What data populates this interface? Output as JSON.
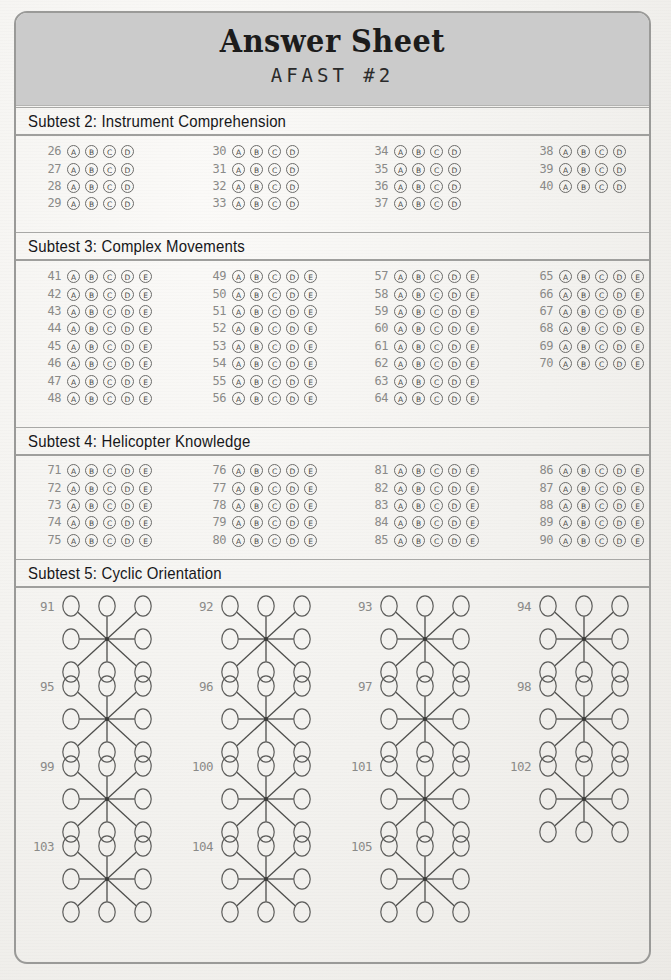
{
  "header": {
    "title": "Answer Sheet",
    "subtitle": "AFAST #2"
  },
  "colors": {
    "page_background": "#f3f2ef",
    "header_band": "#cbcbcb",
    "frame_border": "#9a9a98",
    "question_number": "#8a8a88",
    "bubble_stroke": "#6c6c6a",
    "text": "#17171a"
  },
  "sections": [
    {
      "id": "subtest-2",
      "title": "Subtest 2: Instrument Comprehension",
      "type": "bubbles",
      "options": [
        "A",
        "B",
        "C",
        "D"
      ],
      "columns": [
        {
          "questions": [
            26,
            27,
            28,
            29
          ]
        },
        {
          "questions": [
            30,
            31,
            32,
            33
          ]
        },
        {
          "questions": [
            34,
            35,
            36,
            37
          ]
        },
        {
          "questions": [
            38,
            39,
            40
          ]
        }
      ]
    },
    {
      "id": "subtest-3",
      "title": "Subtest 3: Complex Movements",
      "type": "bubbles",
      "options": [
        "A",
        "B",
        "C",
        "D",
        "E"
      ],
      "columns": [
        {
          "questions": [
            41,
            42,
            43,
            44,
            45,
            46,
            47,
            48
          ]
        },
        {
          "questions": [
            49,
            50,
            51,
            52,
            53,
            54,
            55,
            56
          ]
        },
        {
          "questions": [
            57,
            58,
            59,
            60,
            61,
            62,
            63,
            64
          ]
        },
        {
          "questions": [
            65,
            66,
            67,
            68,
            69,
            70
          ]
        }
      ]
    },
    {
      "id": "subtest-4",
      "title": "Subtest 4: Helicopter Knowledge",
      "type": "bubbles",
      "options": [
        "A",
        "B",
        "C",
        "D",
        "E"
      ],
      "columns": [
        {
          "questions": [
            71,
            72,
            73,
            74,
            75
          ]
        },
        {
          "questions": [
            76,
            77,
            78,
            79,
            80
          ]
        },
        {
          "questions": [
            81,
            82,
            83,
            84,
            85
          ]
        },
        {
          "questions": [
            86,
            87,
            88,
            89,
            90
          ]
        }
      ]
    },
    {
      "id": "subtest-5",
      "title": "Subtest 5: Cyclic Orientation",
      "type": "cyclic",
      "rows": [
        [
          91,
          92,
          93,
          94
        ],
        [
          95,
          96,
          97,
          98
        ],
        [
          99,
          100,
          101,
          102
        ],
        [
          103,
          104,
          105
        ]
      ]
    }
  ]
}
